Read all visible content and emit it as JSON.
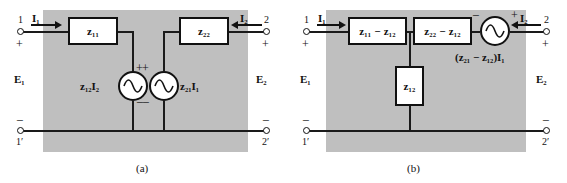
{
  "figure": {
    "panels": [
      {
        "id": "a",
        "caption": "(a)",
        "terminals": {
          "top_left_number": "1",
          "top_left_sign": "+",
          "bottom_left_sign": "−",
          "bottom_left_number": "1′",
          "top_right_number": "2",
          "top_right_sign": "+",
          "bottom_right_sign": "−",
          "bottom_right_number": "2′"
        },
        "currents": {
          "left": "I₁",
          "right": "I₂"
        },
        "voltages": {
          "left": "E₁",
          "right": "E₂"
        },
        "impedance_boxes": [
          {
            "name": "z11-box",
            "label": "z₁₁"
          },
          {
            "name": "z22-box",
            "label": "z₂₂"
          }
        ],
        "sources": [
          {
            "name": "left-dependent-source",
            "label": "z₁₂I₂",
            "plus": "+",
            "minus": "−",
            "label_side": "left"
          },
          {
            "name": "right-dependent-source",
            "label": "z₂₁I₁",
            "plus": "+",
            "minus": "−",
            "label_side": "right"
          }
        ]
      },
      {
        "id": "b",
        "caption": "(b)",
        "terminals": {
          "top_left_number": "1",
          "top_left_sign": "+",
          "bottom_left_sign": "−",
          "bottom_left_number": "1′",
          "top_right_number": "2",
          "top_right_sign": "+",
          "bottom_right_sign": "−",
          "bottom_right_number": "2′"
        },
        "currents": {
          "left": "I₁",
          "right": "I₂"
        },
        "voltages": {
          "left": "E₁",
          "right": "E₂"
        },
        "impedance_boxes": [
          {
            "name": "z11-minus-z12-box",
            "label": "z₁₁ − z₁₂"
          },
          {
            "name": "z22-minus-z12-box",
            "label": "z₂₂ − z₁₂"
          },
          {
            "name": "z12-shunt-box",
            "label": "z₁₂"
          }
        ],
        "sources": [
          {
            "name": "series-dependent-source",
            "label": "(z₂₁ − z₁₂)I₁",
            "plus": "+",
            "minus": "−",
            "label_side": "below"
          }
        ]
      }
    ],
    "colors": {
      "shade": "#bfbfbf",
      "ink": "#111111",
      "paper": "#ffffff"
    }
  }
}
